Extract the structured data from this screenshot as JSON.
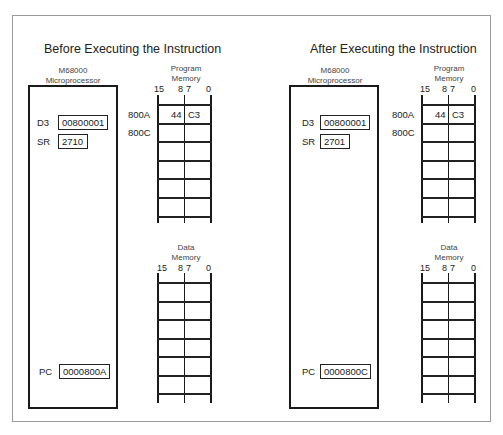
{
  "panels": [
    {
      "title": "Before Executing the Instruction",
      "cpu": {
        "label_line1": "M68000",
        "label_line2": "Microprocessor",
        "registers": {
          "D3": {
            "name": "D3",
            "value": "00800001"
          },
          "SR": {
            "name": "SR",
            "value": "2710"
          },
          "PC": {
            "name": "PC",
            "value": "0000800A"
          }
        }
      },
      "program_memory": {
        "label_line1": "Program",
        "label_line2": "Memory",
        "bit_labels": {
          "b15": "15",
          "b8": "8",
          "b7": "7",
          "b0": "0"
        },
        "addresses": [
          "800A",
          "800C"
        ],
        "rows": [
          {
            "address": "800A",
            "high_byte": "44",
            "low_byte": "C3"
          },
          {
            "address": "800C",
            "high_byte": "",
            "low_byte": ""
          }
        ],
        "row_count": 6
      },
      "data_memory": {
        "label_line1": "Data",
        "label_line2": "Memory",
        "bit_labels": {
          "b15": "15",
          "b8": "8",
          "b7": "7",
          "b0": "0"
        },
        "row_count": 6
      }
    },
    {
      "title": "After Executing the Instruction",
      "cpu": {
        "label_line1": "M68000",
        "label_line2": "Microprocessor",
        "registers": {
          "D3": {
            "name": "D3",
            "value": "00800001"
          },
          "SR": {
            "name": "SR",
            "value": "2701"
          },
          "PC": {
            "name": "PC",
            "value": "0000800C"
          }
        }
      },
      "program_memory": {
        "label_line1": "Program",
        "label_line2": "Memory",
        "bit_labels": {
          "b15": "15",
          "b8": "8",
          "b7": "7",
          "b0": "0"
        },
        "addresses": [
          "800A",
          "800C"
        ],
        "rows": [
          {
            "address": "800A",
            "high_byte": "44",
            "low_byte": "C3"
          },
          {
            "address": "800C",
            "high_byte": "",
            "low_byte": ""
          }
        ],
        "row_count": 6
      },
      "data_memory": {
        "label_line1": "Data",
        "label_line2": "Memory",
        "bit_labels": {
          "b15": "15",
          "b8": "8",
          "b7": "7",
          "b0": "0"
        },
        "row_count": 6
      }
    }
  ],
  "colors": {
    "line": "#1a1a1a",
    "frame": "#9a9a9a",
    "background": "#ffffff"
  }
}
